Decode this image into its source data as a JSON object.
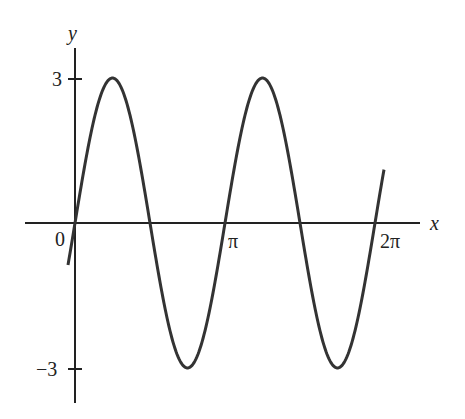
{
  "chart_data": {
    "type": "line",
    "title": "",
    "function": "y = 3 sin(2x)",
    "xlabel": "x",
    "ylabel": "y",
    "x_ticks": [
      {
        "value": 0,
        "label": "0"
      },
      {
        "value": 3.14159,
        "label": "π"
      },
      {
        "value": 6.28318,
        "label": "2π"
      }
    ],
    "y_ticks": [
      {
        "value": 3,
        "label": "3"
      },
      {
        "value": -3,
        "label": "−3"
      }
    ],
    "xlim": [
      -0.1,
      6.5
    ],
    "ylim": [
      -3.5,
      3.5
    ],
    "grid": false,
    "series": [
      {
        "name": "3 sin 2x",
        "amplitude": 3,
        "period": 3.14159,
        "color": "#333333"
      }
    ]
  },
  "labels": {
    "x_axis": "x",
    "y_axis": "y",
    "origin": "0",
    "pi": "π",
    "two_pi": "2π",
    "y_max": "3",
    "y_min": "−3"
  }
}
